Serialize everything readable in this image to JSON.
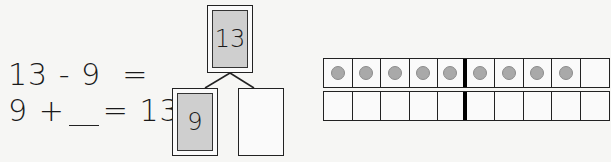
{
  "equations": {
    "subtraction": {
      "left": "13",
      "operator": "-",
      "right": "9",
      "equals": "="
    },
    "addition": {
      "left": "9",
      "operator": "+",
      "blank": "",
      "equals": "=",
      "result": "13"
    }
  },
  "number_bond": {
    "whole": "13",
    "part1": "9",
    "part2": ""
  },
  "ten_frame": {
    "rows": [
      {
        "cells": [
          true,
          true,
          true,
          true,
          true,
          true,
          true,
          true,
          true,
          false
        ]
      },
      {
        "cells": [
          false,
          false,
          false,
          false,
          false,
          false,
          false,
          false,
          false,
          false
        ]
      }
    ],
    "counter_color": "#a9a9a9",
    "counters_filled": 9
  }
}
